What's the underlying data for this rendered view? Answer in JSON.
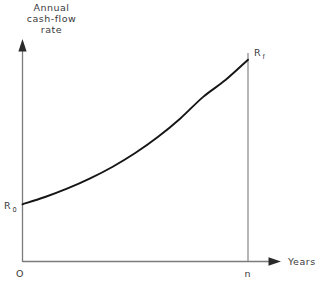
{
  "figure": {
    "background_color": "#ffffff",
    "curve_color": "#151515",
    "axis_color": "#7b7b7b",
    "text_color": "#3a3a3a",
    "y_axis_title_lines": [
      "Annual",
      "cash-flow",
      "rate"
    ],
    "x_axis_title": "Years",
    "origin_label": "O",
    "start_label_base": "R",
    "start_label_sub": "0",
    "end_label_base": "R",
    "end_label_sub": "f",
    "end_tick_label": "n"
  },
  "chart_data": {
    "type": "line",
    "title": "",
    "xlabel": "Years",
    "ylabel": "Annual cash-flow rate",
    "grid": false,
    "legend": null,
    "axis_style": "arrow-axes",
    "xlim": [
      0,
      1.145
    ],
    "ylim": [
      0,
      1.0
    ],
    "xticks": [
      0,
      1
    ],
    "xticklabels": [
      "O",
      "n"
    ],
    "yticks": [
      0.268,
      0.945
    ],
    "yticklabels": [
      "R_0",
      "R_f"
    ],
    "annotations": [
      {
        "text": "R_0",
        "x": 0,
        "y": 0.268,
        "placement": "left-of-axis"
      },
      {
        "text": "R_f",
        "x": 1,
        "y": 0.945,
        "placement": "right-of-point"
      }
    ],
    "series": [
      {
        "name": "Annual cash-flow rate",
        "shape": "exponential-growth",
        "x": [
          0.0,
          0.1,
          0.2,
          0.3,
          0.4,
          0.5,
          0.6,
          0.7,
          0.8,
          0.9,
          1.0
        ],
        "y": [
          0.268,
          0.302,
          0.342,
          0.389,
          0.444,
          0.508,
          0.583,
          0.67,
          0.77,
          0.85,
          0.945
        ]
      }
    ],
    "vertical_drop_lines": [
      {
        "x": 1,
        "y_from": 0,
        "y_to": 0.945
      }
    ]
  }
}
